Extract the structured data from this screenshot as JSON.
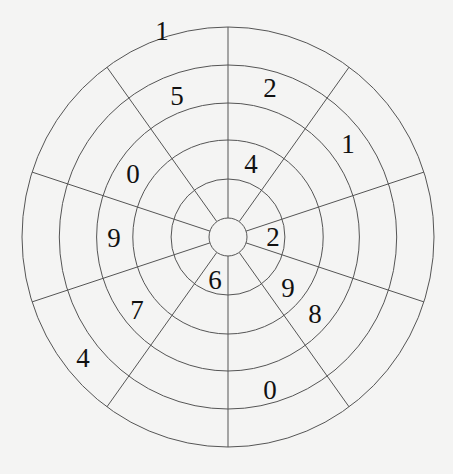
{
  "diagram": {
    "type": "circular-number-grid",
    "center": {
      "x": 228,
      "y": 237
    },
    "ring_radii": [
      19,
      58,
      97,
      134,
      172,
      210
    ],
    "outer_rx": 206,
    "sector_count": 10,
    "spoke_angles_deg": [
      0,
      36,
      72,
      108,
      144,
      180,
      216,
      252,
      288,
      324
    ],
    "line_color": "#555555",
    "background": "#f4f4f3",
    "cells": [
      {
        "value": "1",
        "ring": 5,
        "sector": 9,
        "x": 162,
        "y": 31
      },
      {
        "value": "5",
        "ring": 4,
        "sector": 9,
        "x": 177,
        "y": 96
      },
      {
        "value": "2",
        "ring": 4,
        "sector": 0,
        "x": 270,
        "y": 88
      },
      {
        "value": "1",
        "ring": 4,
        "sector": 1,
        "x": 348,
        "y": 144
      },
      {
        "value": "0",
        "ring": 3,
        "sector": 8,
        "x": 133,
        "y": 174
      },
      {
        "value": "4",
        "ring": 2,
        "sector": 0,
        "x": 251,
        "y": 164
      },
      {
        "value": "9",
        "ring": 3,
        "sector": 7,
        "x": 114,
        "y": 238
      },
      {
        "value": "2",
        "ring": 1,
        "sector": 2,
        "x": 273,
        "y": 237
      },
      {
        "value": "6",
        "ring": 1,
        "sector": 5,
        "x": 215,
        "y": 280
      },
      {
        "value": "7",
        "ring": 3,
        "sector": 6,
        "x": 137,
        "y": 310
      },
      {
        "value": "9",
        "ring": 2,
        "sector": 3,
        "x": 288,
        "y": 288
      },
      {
        "value": "8",
        "ring": 3,
        "sector": 3,
        "x": 315,
        "y": 314
      },
      {
        "value": "4",
        "ring": 5,
        "sector": 6,
        "x": 83,
        "y": 358
      },
      {
        "value": "0",
        "ring": 4,
        "sector": 4,
        "x": 270,
        "y": 390
      }
    ]
  }
}
